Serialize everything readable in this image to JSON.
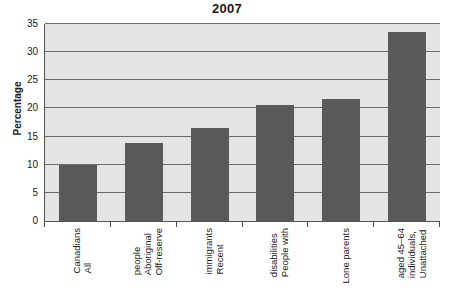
{
  "chart_data": {
    "type": "bar",
    "title": "2007",
    "xlabel": "",
    "ylabel": "Percentage",
    "ylim": [
      0,
      35
    ],
    "ytick_step": 5,
    "yticks": [
      0,
      5,
      10,
      15,
      20,
      25,
      30,
      35
    ],
    "grid": true,
    "legend": null,
    "categories": [
      "All Canadians",
      "Off-reserve Aboriginal people",
      "Recent immigrants",
      "People with disabilities",
      "Lone parents",
      "Unattached individuals, aged 45–64"
    ],
    "category_lines": [
      [
        "All",
        "Canadians"
      ],
      [
        "Off-reserve",
        "Aboriginal",
        "people"
      ],
      [
        "Recent",
        "immigrants"
      ],
      [
        "People with",
        "disabilities"
      ],
      [
        "Lone parents"
      ],
      [
        "Unattached",
        "individuals,",
        "aged 45–64"
      ]
    ],
    "values": [
      10.0,
      13.8,
      16.6,
      20.6,
      21.7,
      33.5
    ],
    "colors": {
      "bar": "#595959",
      "plot_background": "#e4e4e4",
      "gridline": "#6b6b6b",
      "axis": "#555555",
      "text": "#1a1a1a"
    }
  }
}
